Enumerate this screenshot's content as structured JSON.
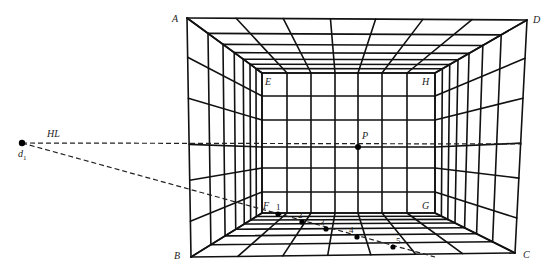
{
  "figure": {
    "labels": {
      "A": "A",
      "B": "B",
      "C": "C",
      "D": "D",
      "E": "E",
      "F": "F",
      "G": "G",
      "H": "H",
      "P": "P",
      "HL": "HL",
      "d1_base": "d",
      "d1_sub": "1"
    },
    "floor_points": [
      "1",
      "2",
      "3",
      "4",
      "5"
    ],
    "colors": {
      "line": "#111111",
      "background": "#ffffff"
    },
    "geometry": {
      "outer": {
        "A": [
          187,
          18
        ],
        "D": [
          527,
          20
        ],
        "B": [
          191,
          257
        ],
        "C": [
          515,
          253
        ]
      },
      "inner": {
        "E": [
          262,
          73
        ],
        "H": [
          435,
          73
        ],
        "F": [
          262,
          213
        ],
        "G": [
          435,
          213
        ]
      },
      "vanishing_point_P": [
        358,
        147
      ],
      "measuring_point_d1": [
        22,
        143
      ],
      "horizon_end_x": 522,
      "diagonal_end": [
        435,
        257
      ],
      "back_wall_cols": [
        262,
        287,
        311,
        335,
        358,
        382,
        407,
        435
      ],
      "back_wall_rows": [
        73,
        96,
        120,
        147,
        168,
        192,
        213
      ],
      "depth_fractions": [
        0,
        0.28,
        0.48,
        0.63,
        0.75,
        0.84,
        0.92,
        1.0
      ],
      "floor_point_coords": [
        [
          278,
          214
        ],
        [
          302,
          222
        ],
        [
          326,
          229
        ],
        [
          357,
          237
        ],
        [
          393,
          247
        ]
      ]
    }
  }
}
